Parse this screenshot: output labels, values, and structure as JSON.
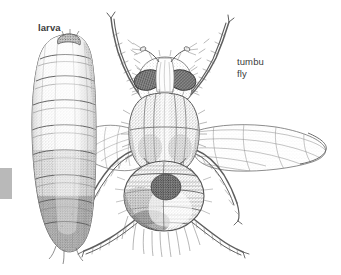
{
  "figure": {
    "type": "scientific-line-illustration",
    "background_color": "#ffffff",
    "width": 341,
    "height": 275,
    "ink_color": "#4a4a4a",
    "text_color": "#3b3b3b"
  },
  "labels": {
    "larva": "larva",
    "fly": "tumbu\nfly"
  },
  "edge_marker": {
    "color": "#b9b9b9"
  },
  "subjects": [
    {
      "name": "larva",
      "description": "segmented maggot, vertical, pale gray shading at head end darkening toward posterior"
    },
    {
      "name": "tumbu-fly",
      "description": "adult fly in dorsal view with compound eyes, striped thorax, banded abdomen, two outspread wings and six bristled legs"
    }
  ]
}
